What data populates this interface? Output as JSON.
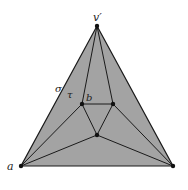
{
  "diagram": {
    "fill_color": "#a3a3a3",
    "edge_color": "#1a1a1a",
    "labels": {
      "apex": "v′",
      "left_vertex": "a",
      "sigma": "σ",
      "tau": "τ",
      "b": "b"
    }
  }
}
